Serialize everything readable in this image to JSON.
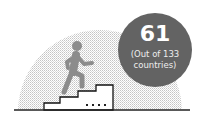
{
  "infographic": {
    "rank": "61",
    "subtitle_line1": "(Out of 133",
    "subtitle_line2": "countries)",
    "colors": {
      "badge": "#636363",
      "figure": "#8c8c8c",
      "stairs": "#111111",
      "halftone": "#c8c8c8"
    },
    "icons": [
      "running-person-icon",
      "stairs-icon"
    ]
  }
}
